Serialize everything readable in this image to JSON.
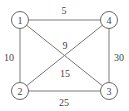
{
  "diagram": {
    "type": "weighted-undirected-graph",
    "nodes": [
      {
        "id": "1",
        "label": "1",
        "x": 20,
        "y": 20
      },
      {
        "id": "2",
        "label": "2",
        "x": 20,
        "y": 91
      },
      {
        "id": "3",
        "label": "3",
        "x": 109,
        "y": 91
      },
      {
        "id": "4",
        "label": "4",
        "x": 109,
        "y": 20
      }
    ],
    "edges": [
      {
        "from": "1",
        "to": "4",
        "weight": "5"
      },
      {
        "from": "1",
        "to": "2",
        "weight": "10"
      },
      {
        "from": "4",
        "to": "3",
        "weight": "30"
      },
      {
        "from": "2",
        "to": "3",
        "weight": "25"
      },
      {
        "from": "1",
        "to": "3",
        "weight": "15"
      },
      {
        "from": "4",
        "to": "2",
        "weight": "9"
      }
    ],
    "colors": {
      "stroke": "#6a6a6a",
      "text": "#444444",
      "background": "#ffffff"
    }
  }
}
